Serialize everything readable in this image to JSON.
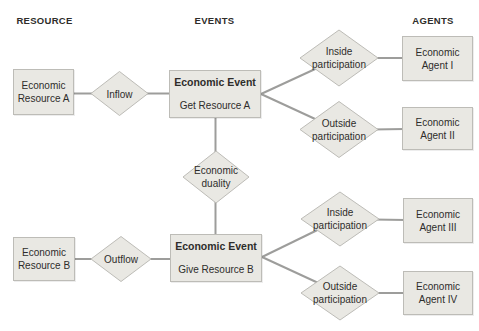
{
  "headers": {
    "resource": "RESOURCE",
    "events": "EVENTS",
    "agents": "AGENTS"
  },
  "nodes": {
    "resource_a": "Economic\nResource A",
    "resource_b": "Economic\nResource B",
    "event_get": {
      "title": "Economic Event",
      "subtitle": "Get Resource A"
    },
    "event_give": {
      "title": "Economic Event",
      "subtitle": "Give Resource B"
    },
    "agent_1": "Economic\nAgent I",
    "agent_2": "Economic\nAgent II",
    "agent_3": "Economic\nAgent III",
    "agent_4": "Economic\nAgent IV"
  },
  "relationships": {
    "inflow": "Inflow",
    "outflow": "Outflow",
    "duality": "Economic\nduality",
    "inside_participation_top": "Inside\nparticipation",
    "outside_participation_top": "Outside\nparticipation",
    "inside_participation_bottom": "Inside\nparticipation",
    "outside_participation_bottom": "Outside\nparticipation"
  },
  "colors": {
    "node_fill": "#e9e8e3",
    "node_border": "#bdbcb7",
    "line": "#9d9d9b",
    "text": "#2e2d2b",
    "background": "#ffffff"
  }
}
